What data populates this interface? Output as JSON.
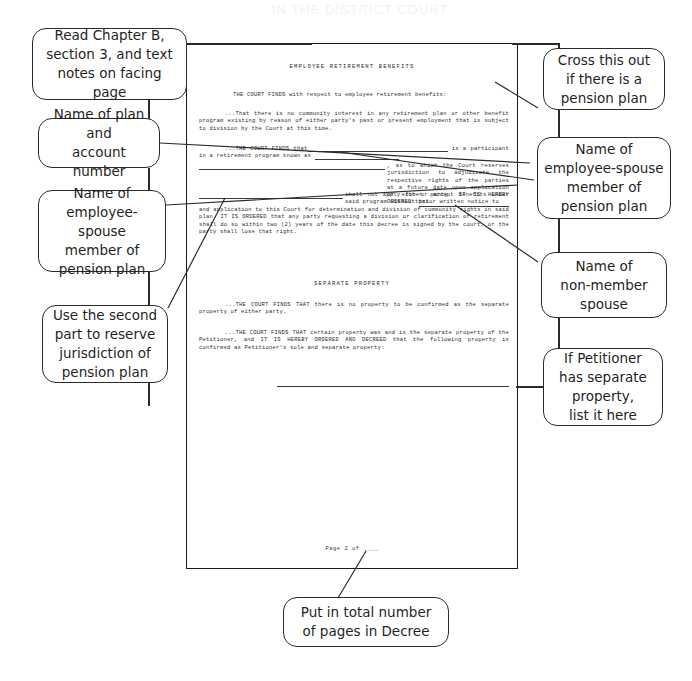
{
  "ghost_header": "IN THE DISTRICT COURT",
  "document": {
    "sections": [
      {
        "id": "employee-retirement-benefits",
        "heading": "EMPLOYEE RETIREMENT BENEFITS",
        "paragraphs": [
          {
            "id": "court-finds-intro",
            "text": "THE COURT FINDS with respect to employee retirement benefits:"
          },
          {
            "id": "no-community-interest",
            "text": "...That there is no community interest in any retirement plan or other benefit program existing by reason of either party's past or present employment that is subject to division by the Court at this time."
          },
          {
            "id": "participant-retirement-program",
            "text_before_blank1": "...THE COURT FINDS that",
            "text_between_1_2": "is a participant in a retirement program known as",
            "text_after_blank2": ", as to which the Court reserves jurisdiction to adjudicate the respective rights of the parties at a future date upon application of either party. IT IS HEREBY ORDERED that",
            "text_after_blank3": "shall not apply for or accept benefits under said program without prior written notice to",
            "text_after_blank4": "and application to this Court for determination and division of community rights in said plan.  IT IS ORDERED that any party requesting a division or clarification of retirement shall do so within two (2) years of the date this decree is signed by the court, or the party shall lose that right."
          }
        ]
      },
      {
        "id": "separate-property",
        "heading": "SEPARATE PROPERTY",
        "paragraphs": [
          {
            "id": "no-separate-property",
            "text": "...THE COURT FINDS THAT there is no property to be confirmed as the separate property of either party."
          },
          {
            "id": "petitioner-separate-property",
            "text": "...THE COURT FINDS THAT certain property was and is the separate property of the Petitioner, and IT IS HEREBY ORDERED AND DECREED that the following property is confirmed as Petitioner's sole and separate property:"
          }
        ]
      }
    ],
    "footer": "Page 2 of ____"
  },
  "annotations": {
    "left": [
      {
        "id": "read-chapter",
        "text": "Read Chapter B,\nsection 3, and text\nnotes on facing page"
      },
      {
        "id": "name-of-plan",
        "text": "Name of plan and\naccount number"
      },
      {
        "id": "name-employee-spouse-left",
        "text": "Name of\nemployee-spouse\nmember of\npension plan"
      },
      {
        "id": "use-second-part",
        "text": "Use the second\npart to reserve\njurisdiction of\npension plan"
      }
    ],
    "right": [
      {
        "id": "cross-this-out",
        "text": "Cross this out\nif there is a\npension plan"
      },
      {
        "id": "name-employee-spouse-right",
        "text": "Name of\nemployee-spouse\nmember of\npension plan"
      },
      {
        "id": "name-non-member-spouse",
        "text": "Name of\nnon-member\nspouse"
      },
      {
        "id": "if-petitioner-separate",
        "text": "If Petitioner\nhas separate\nproperty,\nlist it here"
      }
    ],
    "bottom": [
      {
        "id": "put-total-pages",
        "text": "Put in total number\nof pages in Decree"
      }
    ]
  },
  "colors": {
    "ink": "#1f1f1f",
    "document_text": "#2d2d2d",
    "border": "#2b2b2b",
    "background": "#ffffff"
  }
}
